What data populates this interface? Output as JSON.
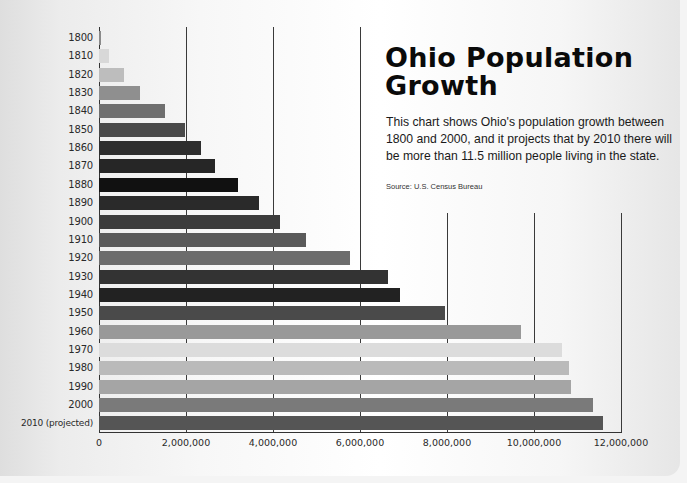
{
  "title": "Ohio Population Growth",
  "description": "This chart shows Ohio's population growth between 1800 and 2000, and it projects that by 2010 there will be more than 11.5 million people living in the state.",
  "source": "Source: U.S. Census Bureau",
  "chart_data": {
    "type": "bar",
    "orientation": "horizontal",
    "title": "Ohio Population Growth",
    "subtitle": "This chart shows Ohio's population growth between 1800 and 2000, and it projects that by 2010 there will be more than 11.5 million people living in the state.",
    "annotation": "Source: U.S. Census Bureau",
    "xlabel": "",
    "ylabel": "",
    "xlim": [
      0,
      12000000
    ],
    "x_ticks": [
      "0",
      "2,000,000",
      "4,000,000",
      "6,000,000",
      "8,000,000",
      "10,000,000",
      "12,000,000"
    ],
    "grid": true,
    "legend": null,
    "categories": [
      "1800",
      "1810",
      "1820",
      "1830",
      "1840",
      "1850",
      "1860",
      "1870",
      "1880",
      "1890",
      "1900",
      "1910",
      "1920",
      "1930",
      "1940",
      "1950",
      "1960",
      "1970",
      "1980",
      "1990",
      "2000",
      "2010 (projected)"
    ],
    "values": [
      45000,
      230000,
      580000,
      940000,
      1520000,
      1980000,
      2340000,
      2670000,
      3200000,
      3670000,
      4160000,
      4770000,
      5760000,
      6650000,
      6910000,
      7950000,
      9710000,
      10650000,
      10800000,
      10850000,
      11350000,
      11580000
    ],
    "bar_colors": [
      "#8a8a8a",
      "#d8d8d8",
      "#bdbdbd",
      "#8f8f8f",
      "#6f6f6f",
      "#4a4a4a",
      "#2e2e2e",
      "#262626",
      "#111111",
      "#2a2a2a",
      "#3c3c3c",
      "#5a5a5a",
      "#6c6c6c",
      "#333333",
      "#222222",
      "#4a4a4a",
      "#999999",
      "#dcdcdc",
      "#bababa",
      "#a5a5a5",
      "#7a7a7a",
      "#555555"
    ]
  }
}
